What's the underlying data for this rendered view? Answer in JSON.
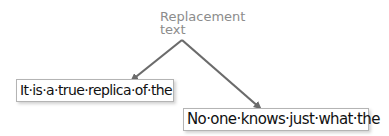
{
  "callout": {
    "label_line1": "Replacement",
    "label_line2": "text",
    "arrow_color": "#6b6b6b",
    "label_color": "#8c8c8c"
  },
  "boxes": [
    {
      "text": "It·is·a·true·replica·of·the"
    },
    {
      "text": "No·one·knows·just·what·the"
    }
  ]
}
